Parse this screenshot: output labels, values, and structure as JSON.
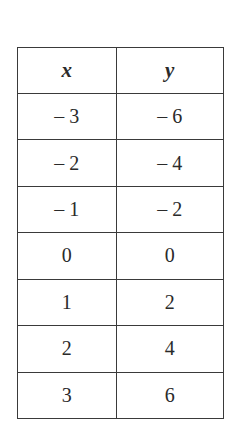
{
  "chart_data": {
    "type": "table",
    "columns": [
      "x",
      "y"
    ],
    "rows": [
      [
        "– 3",
        "– 6"
      ],
      [
        "– 2",
        "– 4"
      ],
      [
        "– 1",
        "– 2"
      ],
      [
        "0",
        "0"
      ],
      [
        "1",
        "2"
      ],
      [
        "2",
        "4"
      ],
      [
        "3",
        "6"
      ]
    ],
    "x": [
      -3,
      -2,
      -1,
      0,
      1,
      2,
      3
    ],
    "y": [
      -6,
      -4,
      -2,
      0,
      2,
      4,
      6
    ]
  },
  "table": {
    "headers": [
      "x",
      "y"
    ],
    "rows": [
      [
        "– 3",
        "– 6"
      ],
      [
        "– 2",
        "– 4"
      ],
      [
        "– 1",
        "– 2"
      ],
      [
        "0",
        "0"
      ],
      [
        "1",
        "2"
      ],
      [
        "2",
        "4"
      ],
      [
        "3",
        "6"
      ]
    ]
  }
}
